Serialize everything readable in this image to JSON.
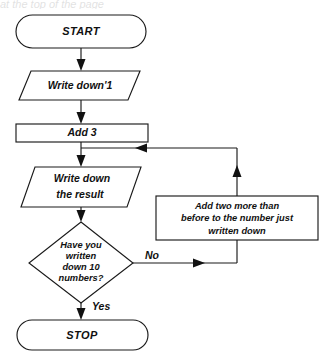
{
  "diagram": {
    "background_color": "#ffffff",
    "line_color": "#1a1a1a",
    "text_color": "#111111",
    "cropped_caption_fragment": "at the top of the page"
  },
  "nodes": {
    "start": {
      "id": "start",
      "shape": "terminal-oval",
      "label": "START"
    },
    "write_one": {
      "id": "write-one",
      "shape": "parallelogram-io",
      "label": "Write down'1"
    },
    "add_three": {
      "id": "add-three",
      "shape": "rectangle-process",
      "label": "Add 3"
    },
    "write_result": {
      "id": "write-result",
      "shape": "parallelogram-io",
      "label_line_1": "Write down",
      "label_line_2": "the result"
    },
    "decision": {
      "id": "decision",
      "shape": "diamond-decision",
      "label_line_1": "Have you",
      "label_line_2": "written",
      "label_line_3": "down 10",
      "label_line_4": "numbers?"
    },
    "add_two_more": {
      "id": "add-two-more",
      "shape": "rectangle-process",
      "label_line_1": "Add two more than",
      "label_line_2": "before to the number just",
      "label_line_3": "written down"
    },
    "stop": {
      "id": "stop",
      "shape": "terminal-oval",
      "label": "STOP"
    }
  },
  "edge_labels": {
    "no": "No",
    "yes": "Yes"
  }
}
